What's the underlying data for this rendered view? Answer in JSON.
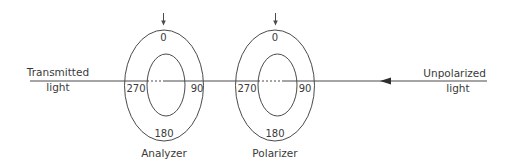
{
  "diagram": {
    "type": "optics-polarization-setup",
    "colors": {
      "line": "#4a4a4a",
      "text": "#3a3a3a",
      "background": "#ffffff"
    },
    "beam": {
      "input_label_line1": "Unpolarized",
      "input_label_line2": "light",
      "output_label_line1": "Transmitted",
      "output_label_line2": "light",
      "direction": "right-to-left"
    },
    "elements": [
      {
        "name": "Analyzer",
        "label": "Analyzer",
        "angles": {
          "top": "0",
          "right": "90",
          "bottom": "180",
          "left": "270"
        }
      },
      {
        "name": "Polarizer",
        "label": "Polarizer",
        "angles": {
          "top": "0",
          "right": "90",
          "bottom": "180",
          "left": "270"
        }
      }
    ]
  }
}
